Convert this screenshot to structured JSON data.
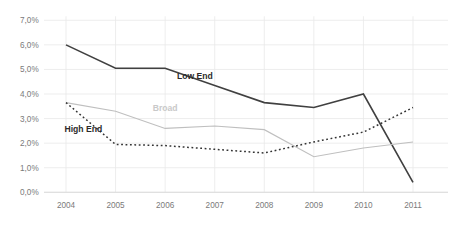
{
  "chart_data": {
    "type": "line",
    "title": "",
    "subtitle": "",
    "xlabel": "",
    "ylabel": "",
    "x": [
      "2004",
      "2005",
      "2006",
      "2007",
      "2008",
      "2009",
      "2010",
      "2011"
    ],
    "categories": [
      "2004",
      "2005",
      "2006",
      "2007",
      "2008",
      "2009",
      "2010",
      "2011"
    ],
    "xticklabels": [
      "2004",
      "2005",
      "2006",
      "2007",
      "2008",
      "2009",
      "2010",
      "2011"
    ],
    "yticklabels": [
      "0,0%",
      "1,0%",
      "2,0%",
      "3,0%",
      "4,0%",
      "5,0%",
      "6,0%",
      "7,0%"
    ],
    "ytickvalues": [
      0.0,
      1.0,
      2.0,
      3.0,
      4.0,
      5.0,
      6.0,
      7.0
    ],
    "ylim": [
      0.0,
      7.0
    ],
    "grid": true,
    "grid_axis": "y",
    "legend": "inline-annotations",
    "legend_position": "inline",
    "value_suffix": "%",
    "decimal_separator": ",",
    "series": [
      {
        "name": "Low End",
        "label": "Low End",
        "style": "solid",
        "color": "#404040",
        "width": 1.6,
        "label_x": 2006.6,
        "label_y": 4.62,
        "label_color": "#2b2b2b",
        "values": [
          6.0,
          5.05,
          5.05,
          4.35,
          3.65,
          3.45,
          4.0,
          0.4
        ]
      },
      {
        "name": "Broad",
        "label": "Broad",
        "style": "solid",
        "color": "#bfbfbf",
        "width": 1.1,
        "label_x": 2006.0,
        "label_y": 3.3,
        "label_color": "#c9c9c9",
        "values": [
          3.65,
          3.3,
          2.6,
          2.7,
          2.55,
          1.45,
          1.8,
          2.05
        ]
      },
      {
        "name": "High End",
        "label": "High End",
        "style": "dotted",
        "color": "#333333",
        "width": 1.5,
        "label_x": 2004.35,
        "label_y": 2.45,
        "label_color": "#2b2b2b",
        "values": [
          3.65,
          1.95,
          1.9,
          1.75,
          1.6,
          2.05,
          2.45,
          3.45
        ]
      }
    ]
  },
  "axis": {
    "y_labels": [
      "7,0%",
      "6,0%",
      "5,0%",
      "4,0%",
      "3,0%",
      "2,0%",
      "1,0%",
      "0,0%"
    ],
    "x_labels": [
      "2004",
      "2005",
      "2006",
      "2007",
      "2008",
      "2009",
      "2010",
      "2011"
    ]
  },
  "labels": {
    "low_end": "Low End",
    "broad": "Broad",
    "high_end": "High End"
  },
  "colors": {
    "low_end": "#404040",
    "broad": "#bfbfbf",
    "high_end": "#333333",
    "grid": "#e8e8e8",
    "tick_text": "#7a7a7a",
    "background": "#ffffff"
  }
}
